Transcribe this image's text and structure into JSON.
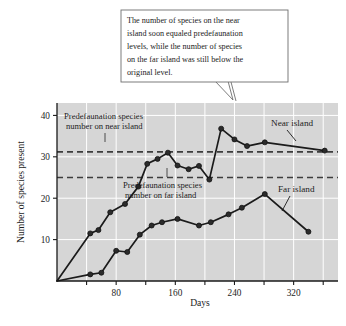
{
  "callout": {
    "lines": [
      "The number of species on the near",
      "island soon equaled predefaunation",
      "levels, while the number of species",
      "on the far island was still below the",
      "original level."
    ],
    "border_color": "#6e6e6e",
    "background_color": "#ffffff"
  },
  "chart_data": {
    "type": "line",
    "title": "",
    "subtitle": "",
    "xlabel": "Days",
    "ylabel": "Number of species present",
    "xlim": [
      0,
      380
    ],
    "ylim": [
      0,
      43
    ],
    "xticks": [
      80,
      160,
      240,
      320
    ],
    "xticks_minor": [
      40,
      120,
      200,
      280,
      360
    ],
    "yticks": [
      10,
      20,
      30,
      40
    ],
    "grid": true,
    "grid_color": "#ffffff",
    "plot_background": "#d6d6d6",
    "legend": "inline-labels",
    "series": [
      {
        "name": "Near island",
        "color": "#1b1b1b",
        "marker": "circle",
        "x": [
          0,
          45,
          56,
          72,
          92,
          110,
          122,
          136,
          150,
          163,
          178,
          192,
          206,
          222,
          240,
          257,
          281,
          362
        ],
        "y": [
          0,
          11.5,
          12.3,
          16.6,
          18.6,
          22.8,
          28.3,
          29.5,
          31.0,
          27.9,
          27.0,
          27.8,
          24.5,
          36.8,
          34.2,
          32.6,
          33.5,
          31.5
        ]
      },
      {
        "name": "Far island",
        "color": "#1b1b1b",
        "marker": "circle",
        "x": [
          0,
          45,
          60,
          80,
          95,
          112,
          128,
          142,
          163,
          192,
          208,
          232,
          250,
          281,
          340
        ],
        "y": [
          0,
          1.6,
          2.0,
          7.3,
          7.0,
          11.2,
          13.4,
          14.2,
          15.0,
          13.4,
          14.2,
          16.1,
          17.7,
          21.0,
          11.9
        ]
      }
    ],
    "reference_lines": [
      {
        "name": "Predefaunation species number on near island",
        "value": 31.2,
        "style": "dashed",
        "color": "#3c3c3c"
      },
      {
        "name": "Predefaunation species number on far island",
        "value": 25.0,
        "style": "dashed",
        "color": "#3c3c3c"
      }
    ],
    "annotations": [
      {
        "id": "near-reference-annotation",
        "lines": [
          "Predefaunation species",
          "number on near island"
        ]
      },
      {
        "id": "far-reference-annotation",
        "lines": [
          "Predefaunation species",
          "number on far island"
        ]
      },
      {
        "id": "near-series-annotation",
        "text": "Near island"
      },
      {
        "id": "far-series-annotation",
        "text": "Far island"
      }
    ]
  },
  "axis": {
    "ylabel": "Number of species present",
    "xlabel": "Days",
    "ytick_labels": [
      "10",
      "20",
      "30",
      "40"
    ],
    "xtick_labels": [
      "80",
      "160",
      "240",
      "320"
    ]
  },
  "annotations": {
    "near_ref_line1": "Predefaunation species",
    "near_ref_line2": "number on near island",
    "far_ref_line1": "Predefaunation species",
    "far_ref_line2": "number on far island",
    "near_series": "Near island",
    "far_series": "Far island"
  }
}
